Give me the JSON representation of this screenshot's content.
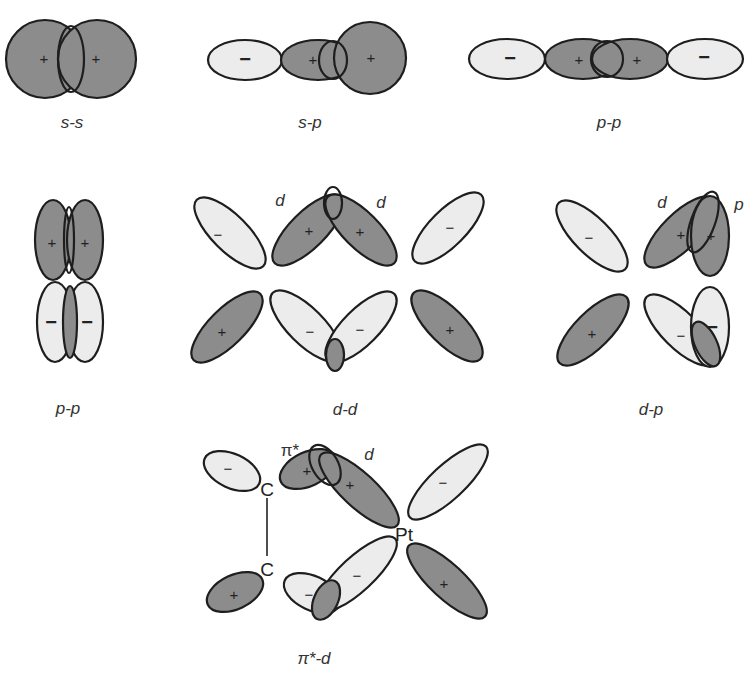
{
  "diagram": {
    "colors": {
      "positive_lobe": "#8c8c8c",
      "negative_lobe": "#ececec",
      "outline": "#1e1e1e"
    },
    "panels": [
      {
        "id": "s-s",
        "caption": "s-s",
        "signs": [
          "+",
          "+"
        ]
      },
      {
        "id": "s-p",
        "caption": "s-p",
        "signs": [
          "−",
          "+",
          "+"
        ]
      },
      {
        "id": "p-p-sigma",
        "caption": "p-p",
        "signs": [
          "−",
          "+",
          "+",
          "−"
        ]
      },
      {
        "id": "p-p-pi",
        "caption": "p-p",
        "signs": [
          "+",
          "+",
          "−",
          "−"
        ]
      },
      {
        "id": "d-d",
        "caption": "d-d",
        "labels": [
          "d",
          "d"
        ],
        "signs": [
          "−",
          "+",
          "+",
          "−",
          "+",
          "−",
          "−",
          "+"
        ]
      },
      {
        "id": "d-p",
        "caption": "d-p",
        "labels": [
          "d",
          "p"
        ],
        "signs": [
          "−",
          "+",
          "+",
          "+",
          "−",
          "−"
        ]
      },
      {
        "id": "pi-star-d",
        "caption": "π*-d",
        "labels": [
          "π*",
          "d"
        ],
        "atoms": [
          "C",
          "C",
          "Pt"
        ],
        "signs": [
          "−",
          "+",
          "+",
          "−",
          "+",
          "−",
          "−",
          "+"
        ]
      }
    ]
  },
  "labels": {
    "ss_caption": "s-s",
    "sp_caption": "s-p",
    "pp_sigma_caption": "p-p",
    "pp_pi_caption": "p-p",
    "dd_caption": "d-d",
    "dp_caption": "d-p",
    "pid_caption": "π*-d",
    "d": "d",
    "p": "p",
    "pi_star": "π*",
    "carbon": "C",
    "platinum": "Pt",
    "plus": "+",
    "minus": "−"
  }
}
